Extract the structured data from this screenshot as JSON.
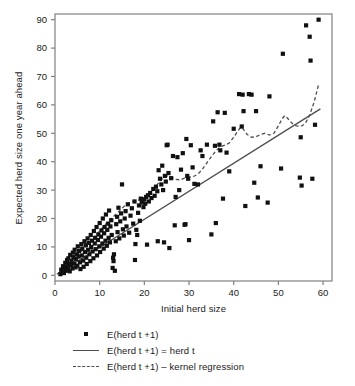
{
  "chart_data": {
    "type": "scatter",
    "title": "",
    "xlabel": "Initial herd size",
    "ylabel": "Expected herd size one year ahead",
    "xlim": [
      0,
      62
    ],
    "ylim": [
      -2,
      92
    ],
    "xticks": [
      0,
      10,
      20,
      30,
      40,
      50,
      60
    ],
    "yticks": [
      0,
      10,
      20,
      30,
      40,
      50,
      60,
      70,
      80,
      90
    ],
    "grid": false,
    "legend_position": "bottom",
    "legend": [
      {
        "key": "square-marker",
        "label": "E(herd t +1)"
      },
      {
        "key": "solid-line",
        "label": "E(herd t +1) = herd t"
      },
      {
        "key": "dashed-line",
        "label": "E(herd t +1) – kernel regression"
      }
    ],
    "colors": {
      "marker": "#111111",
      "identity_line": "#4d4d4d",
      "kernel_line": "#4d4d4d",
      "axis": "#808080",
      "background": "#ffffff"
    },
    "series": [
      {
        "name": "E(herd t +1)",
        "type": "scatter",
        "marker": "square",
        "points": [
          [
            1.2,
            0.4
          ],
          [
            1.4,
            2.0
          ],
          [
            1.6,
            1.0
          ],
          [
            1.8,
            3.2
          ],
          [
            2.0,
            0.8
          ],
          [
            2.1,
            2.6
          ],
          [
            2.3,
            4.4
          ],
          [
            2.4,
            1.6
          ],
          [
            2.6,
            3.0
          ],
          [
            2.7,
            5.4
          ],
          [
            2.9,
            2.2
          ],
          [
            3.0,
            6.0
          ],
          [
            3.1,
            4.0
          ],
          [
            3.3,
            1.4
          ],
          [
            3.4,
            7.2
          ],
          [
            3.6,
            3.6
          ],
          [
            3.7,
            5.0
          ],
          [
            3.9,
            2.4
          ],
          [
            4.0,
            8.0
          ],
          [
            4.1,
            6.4
          ],
          [
            4.3,
            4.2
          ],
          [
            4.4,
            9.0
          ],
          [
            4.6,
            2.8
          ],
          [
            4.7,
            5.8
          ],
          [
            4.9,
            7.4
          ],
          [
            5.0,
            3.4
          ],
          [
            5.1,
            10.2
          ],
          [
            5.3,
            6.6
          ],
          [
            5.4,
            8.6
          ],
          [
            5.6,
            4.6
          ],
          [
            5.7,
            2.2
          ],
          [
            5.9,
            11.0
          ],
          [
            6.0,
            7.0
          ],
          [
            6.1,
            9.4
          ],
          [
            6.3,
            5.2
          ],
          [
            6.4,
            3.0
          ],
          [
            6.6,
            12.0
          ],
          [
            6.7,
            8.2
          ],
          [
            6.9,
            10.6
          ],
          [
            7.0,
            6.2
          ],
          [
            7.1,
            4.0
          ],
          [
            7.3,
            13.0
          ],
          [
            7.4,
            9.0
          ],
          [
            7.6,
            11.4
          ],
          [
            7.7,
            7.4
          ],
          [
            7.9,
            5.0
          ],
          [
            8.0,
            14.2
          ],
          [
            8.1,
            10.0
          ],
          [
            8.3,
            12.2
          ],
          [
            8.4,
            8.4
          ],
          [
            8.6,
            6.0
          ],
          [
            8.7,
            15.6
          ],
          [
            8.9,
            11.2
          ],
          [
            9.0,
            13.2
          ],
          [
            9.1,
            9.2
          ],
          [
            9.3,
            17.0
          ],
          [
            9.4,
            7.0
          ],
          [
            9.6,
            12.4
          ],
          [
            9.7,
            14.4
          ],
          [
            9.9,
            10.2
          ],
          [
            10.0,
            18.4
          ],
          [
            10.1,
            8.2
          ],
          [
            10.3,
            13.6
          ],
          [
            10.4,
            15.8
          ],
          [
            10.6,
            11.2
          ],
          [
            10.7,
            20.0
          ],
          [
            10.9,
            9.4
          ],
          [
            11.0,
            14.8
          ],
          [
            11.1,
            17.0
          ],
          [
            11.3,
            12.2
          ],
          [
            11.4,
            21.4
          ],
          [
            11.6,
            10.4
          ],
          [
            11.7,
            16.0
          ],
          [
            11.9,
            18.2
          ],
          [
            12.0,
            13.2
          ],
          [
            12.1,
            22.8
          ],
          [
            12.3,
            11.6
          ],
          [
            12.4,
            17.2
          ],
          [
            12.6,
            19.4
          ],
          [
            12.7,
            14.2
          ],
          [
            12.9,
            2.6
          ],
          [
            13.0,
            6.2
          ],
          [
            13.1,
            5.0
          ],
          [
            13.2,
            7.4
          ],
          [
            13.4,
            1.6
          ],
          [
            13.6,
            12.0
          ],
          [
            13.7,
            18.0
          ],
          [
            13.9,
            20.6
          ],
          [
            14.0,
            15.2
          ],
          [
            14.2,
            23.8
          ],
          [
            14.4,
            13.0
          ],
          [
            14.6,
            19.0
          ],
          [
            14.8,
            21.8
          ],
          [
            15.0,
            32.0
          ],
          [
            15.2,
            16.2
          ],
          [
            15.4,
            14.0
          ],
          [
            15.6,
            20.0
          ],
          [
            15.8,
            22.6
          ],
          [
            16.0,
            17.2
          ],
          [
            16.3,
            25.0
          ],
          [
            16.6,
            15.0
          ],
          [
            16.9,
            21.0
          ],
          [
            17.2,
            23.6
          ],
          [
            17.5,
            18.2
          ],
          [
            17.8,
            26.0
          ],
          [
            17.9,
            5.4
          ],
          [
            18.0,
            11.0
          ],
          [
            18.2,
            16.0
          ],
          [
            18.4,
            14.2
          ],
          [
            18.6,
            22.0
          ],
          [
            18.8,
            24.6
          ],
          [
            19.0,
            19.2
          ],
          [
            19.2,
            27.0
          ],
          [
            19.4,
            25.6
          ],
          [
            19.6,
            26.4
          ],
          [
            19.8,
            24.0
          ],
          [
            20.0,
            26.8
          ],
          [
            20.2,
            25.2
          ],
          [
            20.4,
            27.6
          ],
          [
            20.6,
            10.8
          ],
          [
            20.8,
            28.2
          ],
          [
            21.0,
            26.0
          ],
          [
            21.3,
            29.0
          ],
          [
            21.6,
            27.2
          ],
          [
            22.0,
            30.4
          ],
          [
            22.3,
            28.0
          ],
          [
            22.6,
            31.2
          ],
          [
            22.9,
            29.6
          ],
          [
            23.0,
            12.0
          ],
          [
            23.2,
            37.0
          ],
          [
            23.5,
            34.0
          ],
          [
            23.8,
            32.0
          ],
          [
            24.0,
            38.6
          ],
          [
            24.2,
            30.0
          ],
          [
            24.4,
            11.6
          ],
          [
            24.6,
            35.0
          ],
          [
            24.8,
            33.0
          ],
          [
            25.0,
            45.8
          ],
          [
            25.2,
            46.0
          ],
          [
            25.4,
            36.0
          ],
          [
            25.6,
            9.6
          ],
          [
            26.0,
            34.2
          ],
          [
            26.4,
            42.0
          ],
          [
            26.8,
            17.6
          ],
          [
            27.0,
            27.6
          ],
          [
            27.4,
            41.6
          ],
          [
            27.8,
            30.0
          ],
          [
            28.2,
            37.2
          ],
          [
            28.6,
            43.0
          ],
          [
            29.0,
            17.8
          ],
          [
            29.2,
            18.0
          ],
          [
            29.4,
            48.0
          ],
          [
            29.6,
            35.0
          ],
          [
            29.8,
            34.0
          ],
          [
            30.0,
            12.4
          ],
          [
            30.4,
            45.8
          ],
          [
            30.8,
            38.0
          ],
          [
            31.2,
            32.2
          ],
          [
            32.0,
            32.0
          ],
          [
            32.6,
            44.0
          ],
          [
            33.0,
            42.0
          ],
          [
            34.0,
            46.0
          ],
          [
            35.0,
            14.4
          ],
          [
            35.4,
            54.2
          ],
          [
            35.8,
            45.6
          ],
          [
            36.0,
            18.4
          ],
          [
            36.4,
            57.4
          ],
          [
            36.8,
            46.0
          ],
          [
            37.0,
            44.0
          ],
          [
            37.6,
            27.0
          ],
          [
            38.0,
            57.2
          ],
          [
            38.4,
            43.2
          ],
          [
            39.0,
            36.6
          ],
          [
            40.0,
            51.6
          ],
          [
            41.2,
            63.8
          ],
          [
            41.8,
            52.4
          ],
          [
            42.0,
            63.6
          ],
          [
            42.2,
            57.8
          ],
          [
            42.6,
            24.4
          ],
          [
            43.4,
            63.8
          ],
          [
            44.0,
            63.6
          ],
          [
            44.6,
            32.6
          ],
          [
            45.0,
            57.8
          ],
          [
            45.4,
            27.4
          ],
          [
            46.0,
            38.4
          ],
          [
            47.6,
            25.6
          ],
          [
            48.0,
            63.0
          ],
          [
            50.6,
            37.6
          ],
          [
            51.0,
            78.0
          ],
          [
            54.8,
            34.4
          ],
          [
            55.0,
            48.6
          ],
          [
            55.2,
            31.6
          ],
          [
            56.2,
            88.0
          ],
          [
            57.0,
            84.0
          ],
          [
            57.2,
            75.6
          ],
          [
            57.6,
            34.0
          ],
          [
            58.2,
            53.0
          ],
          [
            59.0,
            90.0
          ]
        ]
      },
      {
        "name": "E(herd t +1) = herd t",
        "type": "line",
        "style": "solid",
        "points": [
          [
            0.4,
            0.4
          ],
          [
            59.4,
            58.6
          ]
        ]
      },
      {
        "name": "E(herd t +1) – kernel regression",
        "type": "line",
        "style": "dashed",
        "points": [
          [
            1.0,
            1.0
          ],
          [
            2.0,
            2.4
          ],
          [
            3.0,
            4.0
          ],
          [
            4.0,
            5.6
          ],
          [
            5.0,
            7.0
          ],
          [
            6.0,
            8.6
          ],
          [
            7.0,
            10.2
          ],
          [
            8.0,
            12.0
          ],
          [
            9.0,
            13.8
          ],
          [
            10.0,
            15.6
          ],
          [
            11.0,
            17.4
          ],
          [
            12.0,
            19.2
          ],
          [
            13.0,
            20.6
          ],
          [
            14.0,
            22.0
          ],
          [
            15.0,
            23.6
          ],
          [
            16.0,
            25.0
          ],
          [
            17.0,
            25.8
          ],
          [
            18.0,
            26.2
          ],
          [
            19.0,
            26.6
          ],
          [
            20.0,
            27.4
          ],
          [
            21.0,
            28.6
          ],
          [
            22.0,
            30.2
          ],
          [
            23.0,
            32.2
          ],
          [
            24.0,
            34.0
          ],
          [
            25.0,
            35.0
          ],
          [
            26.0,
            34.6
          ],
          [
            27.0,
            33.8
          ],
          [
            28.0,
            33.6
          ],
          [
            29.0,
            34.2
          ],
          [
            30.0,
            34.6
          ],
          [
            31.0,
            34.8
          ],
          [
            32.0,
            35.6
          ],
          [
            33.0,
            37.4
          ],
          [
            34.0,
            39.6
          ],
          [
            35.0,
            41.8
          ],
          [
            36.0,
            43.8
          ],
          [
            37.0,
            45.2
          ],
          [
            38.0,
            45.8
          ],
          [
            39.0,
            46.6
          ],
          [
            40.0,
            48.6
          ],
          [
            41.0,
            51.0
          ],
          [
            41.6,
            52.2
          ],
          [
            42.2,
            51.4
          ],
          [
            43.0,
            49.6
          ],
          [
            44.0,
            48.6
          ],
          [
            45.0,
            48.8
          ],
          [
            46.0,
            49.6
          ],
          [
            47.0,
            50.0
          ],
          [
            48.0,
            49.4
          ],
          [
            49.0,
            50.0
          ],
          [
            50.0,
            52.6
          ],
          [
            50.8,
            55.0
          ],
          [
            51.4,
            56.2
          ],
          [
            52.0,
            55.4
          ],
          [
            53.0,
            53.6
          ],
          [
            54.0,
            52.6
          ],
          [
            55.0,
            52.4
          ],
          [
            56.0,
            53.4
          ],
          [
            57.0,
            56.4
          ],
          [
            58.0,
            61.0
          ],
          [
            59.0,
            67.2
          ]
        ]
      }
    ]
  }
}
